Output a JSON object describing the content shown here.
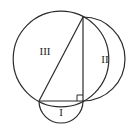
{
  "diagram": {
    "type": "geometry",
    "stroke_color": "#2a2a2a",
    "background": "#ffffff",
    "labels": {
      "region_small": "I",
      "region_medium": "II",
      "region_large": "III"
    },
    "vertices": {
      "top": [
        83,
        17
      ],
      "bottom_left": [
        39,
        101
      ],
      "right_angle": [
        83,
        101
      ]
    },
    "right_angle_marker": true
  }
}
